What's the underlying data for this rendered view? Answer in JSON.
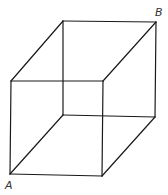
{
  "diagram": {
    "type": "wireframe-cube",
    "colors": {
      "edge": "#1a1a1a",
      "label": "#333333",
      "background": "#ffffff"
    },
    "labels": [
      {
        "id": "A",
        "text": "A",
        "x": 5,
        "y": 189
      },
      {
        "id": "B",
        "text": "B",
        "x": 155,
        "y": 16
      }
    ],
    "vertices": {
      "front_top_left": [
        11,
        81
      ],
      "front_top_right": [
        103,
        81
      ],
      "front_bottom_left": [
        10,
        174
      ],
      "front_bottom_right": [
        102,
        176
      ],
      "back_top_left": [
        63,
        21
      ],
      "back_top_right": [
        156,
        22
      ],
      "back_bottom_left": [
        63,
        115
      ],
      "back_bottom_right": [
        155,
        117
      ]
    }
  }
}
